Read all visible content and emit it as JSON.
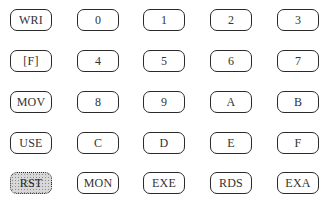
{
  "keypad": {
    "rows": [
      {
        "keys": [
          {
            "label": "WRI"
          },
          {
            "label": "0"
          },
          {
            "label": "1"
          },
          {
            "label": "2"
          },
          {
            "label": "3"
          }
        ]
      },
      {
        "keys": [
          {
            "label": "[F]"
          },
          {
            "label": "4"
          },
          {
            "label": "5"
          },
          {
            "label": "6"
          },
          {
            "label": "7"
          }
        ]
      },
      {
        "keys": [
          {
            "label": "MOV"
          },
          {
            "label": "8"
          },
          {
            "label": "9"
          },
          {
            "label": "A"
          },
          {
            "label": "B"
          }
        ]
      },
      {
        "keys": [
          {
            "label": "USE"
          },
          {
            "label": "C"
          },
          {
            "label": "D"
          },
          {
            "label": "E"
          },
          {
            "label": "F"
          }
        ]
      },
      {
        "keys": [
          {
            "label": "RST",
            "highlighted": true
          },
          {
            "label": "MON"
          },
          {
            "label": "EXE"
          },
          {
            "label": "RDS"
          },
          {
            "label": "EXA"
          }
        ]
      }
    ],
    "colors": {
      "key_border": "#2a2a2a",
      "key_text": "#333333",
      "highlight_fill": "#d8d8d8"
    }
  }
}
